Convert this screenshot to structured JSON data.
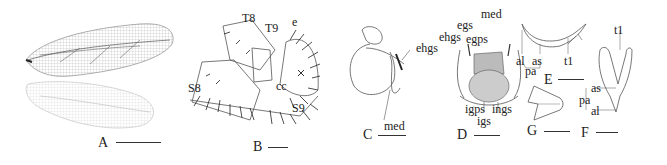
{
  "figure": {
    "panels": [
      {
        "id": "A",
        "label": "A",
        "description": "fore wing and hind wing"
      },
      {
        "id": "B",
        "label": "B",
        "description": "male terminalia, lateral view",
        "annotations": [
          "T8",
          "T9",
          "e",
          "cc",
          "S8",
          "S9"
        ]
      },
      {
        "id": "C",
        "label": "C",
        "description": "genitalia, lateral view",
        "annotations": [
          "ehgs",
          "med"
        ]
      },
      {
        "id": "D",
        "label": "D",
        "description": "genitalia, dorsal view",
        "annotations": [
          "egs",
          "med",
          "ehgs",
          "egps",
          "igps",
          "ings",
          "igs"
        ]
      },
      {
        "id": "E",
        "label": "E",
        "description": "structure, lateral view",
        "annotations": [
          "al",
          "as",
          "t1",
          "pa"
        ]
      },
      {
        "id": "G",
        "label": "G",
        "description": "small sclerite"
      },
      {
        "id": "F",
        "label": "F",
        "description": "structure, ventral view",
        "annotations": [
          "t1",
          "as",
          "pa",
          "al"
        ]
      }
    ],
    "labels": {
      "A": "A",
      "B": "B",
      "C": "C",
      "D": "D",
      "E": "E",
      "F": "F",
      "G": "G",
      "T8": "T8",
      "T9": "T9",
      "e": "e",
      "cc": "cc",
      "S8": "S8",
      "S9": "S9",
      "ehgs": "ehgs",
      "med": "med",
      "egs": "egs",
      "egps": "egps",
      "igps": "igps",
      "ings": "ings",
      "igs": "igs",
      "al": "al",
      "as": "as",
      "t1": "t1",
      "pa": "pa"
    }
  }
}
